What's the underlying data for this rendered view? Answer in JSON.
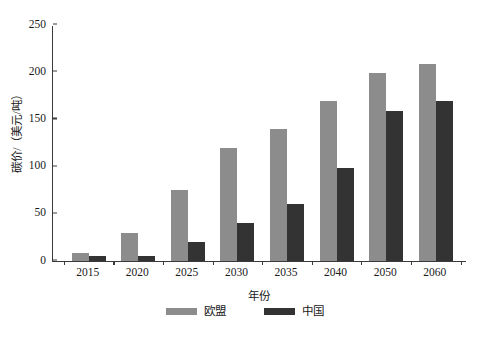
{
  "chart_data": {
    "type": "bar",
    "title": "",
    "subtitle": "",
    "xlabel": "年份",
    "ylabel": "碳价/（美元/吨）",
    "categories": [
      "2015",
      "2020",
      "2025",
      "2030",
      "2035",
      "2040",
      "2050",
      "2060"
    ],
    "series": [
      {
        "name": "欧盟",
        "color": "#8c8c8c",
        "values": [
          8,
          30,
          75,
          120,
          140,
          169,
          199,
          209
        ]
      },
      {
        "name": "中国",
        "color": "#333333",
        "values": [
          5,
          5,
          20,
          40,
          60,
          99,
          159,
          169
        ]
      }
    ],
    "ylim": [
      0,
      250
    ],
    "yticks": [
      0,
      50,
      100,
      150,
      200,
      250
    ],
    "ytick_labels": [
      "0",
      "50",
      "100",
      "150",
      "200",
      "250"
    ],
    "grid": false,
    "legend_position": "bottom-center",
    "axis_color": "#3a3a3a",
    "background": "#ffffff"
  }
}
